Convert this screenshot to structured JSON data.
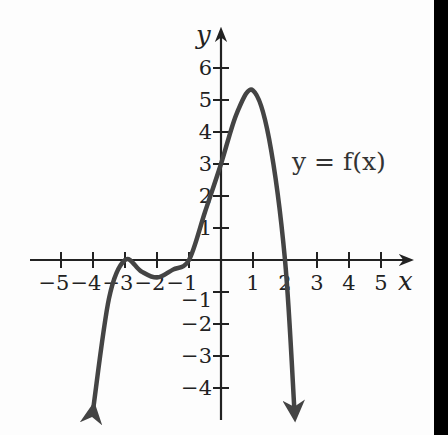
{
  "chart_data": {
    "type": "line",
    "title": "",
    "xlabel": "x",
    "ylabel": "y",
    "curve_label": "y = f(x)",
    "xlim": [
      -5.5,
      5.7
    ],
    "ylim": [
      -4.8,
      6.8
    ],
    "x_ticks": [
      -5,
      -4,
      -3,
      -2,
      -1,
      1,
      2,
      3,
      4,
      5
    ],
    "y_ticks": [
      -4,
      -3,
      -2,
      -1,
      1,
      2,
      3,
      4,
      5,
      6
    ],
    "x_tick_labels": [
      "−5",
      "−4",
      "−3",
      "−2",
      "−1",
      "1",
      "2",
      "3",
      "4",
      "5"
    ],
    "y_tick_labels": [
      "−4",
      "−3",
      "−2",
      "−1",
      "1",
      "2",
      "3",
      "4",
      "5",
      "6"
    ],
    "grid": false,
    "series": [
      {
        "name": "f(x)",
        "x": [
          -4.0,
          -3.5,
          -3.0,
          -2.5,
          -2.0,
          -1.5,
          -1.0,
          -0.5,
          0.0,
          0.5,
          1.0,
          1.5,
          2.0,
          2.3
        ],
        "y": [
          -4.7,
          -1.2,
          0.0,
          -0.35,
          -0.55,
          -0.3,
          0.0,
          1.5,
          3.0,
          4.6,
          5.3,
          3.8,
          0.0,
          -4.8
        ],
        "features": {
          "zeros": [
            -3,
            -1,
            2
          ],
          "local_max": [
            1,
            5.3
          ],
          "local_min": [
            -1.9,
            -0.5
          ],
          "touches_axis_at": -3,
          "y_intercept": 3,
          "end_behavior": "both ends arrow downward"
        }
      }
    ]
  }
}
